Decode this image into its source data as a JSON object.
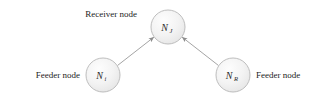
{
  "diagram": {
    "colors": {
      "node_fill_light": "#fbfbfb",
      "node_fill_shade": "#ebebeb",
      "node_stroke": "#b7b7b7",
      "edge_stroke": "#9a9a9a",
      "text": "#1c1c1c",
      "background": "#ffffff"
    },
    "nodes": [
      {
        "id": "receiver",
        "symbol": "N",
        "subscript": "J",
        "caption": "Receiver node",
        "cx": 168,
        "cy": 27,
        "r": 17
      },
      {
        "id": "feeder-left",
        "symbol": "N",
        "subscript": "i",
        "caption": "Feeder node",
        "cx": 103,
        "cy": 75,
        "r": 17
      },
      {
        "id": "feeder-right",
        "symbol": "N",
        "subscript": "R",
        "caption": "Feeder node",
        "cx": 233,
        "cy": 75,
        "r": 17
      }
    ],
    "edges": [
      {
        "id": "edge-left-to-receiver",
        "from": "feeder-left",
        "to": "receiver",
        "arrow": "to"
      },
      {
        "id": "edge-right-to-receiver",
        "from": "feeder-right",
        "to": "receiver",
        "arrow": "to"
      }
    ],
    "captions": {
      "receiver": "Receiver node",
      "feeder_left": "Feeder node",
      "feeder_right": "Feeder node"
    }
  }
}
